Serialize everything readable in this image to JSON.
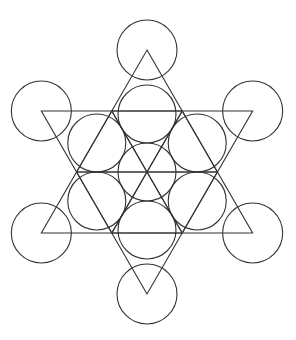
{
  "figure": {
    "title": "",
    "stroke_color": "#333333",
    "background": "#ffffff",
    "center": [
      147,
      172
    ],
    "outer_circle_radius": 30,
    "inner_circle_radius": 29,
    "outer_circle_distance": 122,
    "triangle_vertex_distance": 122,
    "ring_circle_distance": 58
  }
}
